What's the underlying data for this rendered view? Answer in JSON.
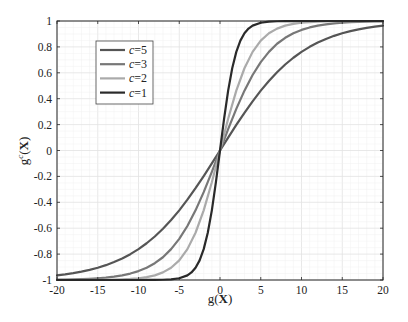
{
  "chart_data": {
    "type": "line",
    "title": "",
    "xlabel": "g(X)",
    "ylabel": "g^c(X)",
    "xlim": [
      -20,
      20
    ],
    "ylim": [
      -1,
      1
    ],
    "xticks": [
      -20,
      -15,
      -10,
      -5,
      0,
      5,
      10,
      15,
      20
    ],
    "yticks": [
      -1,
      -0.8,
      -0.6,
      -0.4,
      -0.2,
      0,
      0.2,
      0.4,
      0.6,
      0.8,
      1
    ],
    "grid": true,
    "minor_grid": true,
    "legend_position": "upper left",
    "series": [
      {
        "name": "c=5",
        "color": "#555555",
        "x": [
          -20,
          -19,
          -18,
          -17,
          -16,
          -15,
          -14,
          -13,
          -12,
          -11,
          -10,
          -9,
          -8,
          -7,
          -6,
          -5,
          -4,
          -3,
          -2,
          -1,
          0,
          1,
          2,
          3,
          4,
          5,
          6,
          7,
          8,
          9,
          10,
          11,
          12,
          13,
          14,
          15,
          16,
          17,
          18,
          19,
          20
        ],
        "values": [
          -0.964,
          -0.9562,
          -0.9468,
          -0.9354,
          -0.9217,
          -0.9051,
          -0.8854,
          -0.8617,
          -0.8337,
          -0.8005,
          -0.7616,
          -0.7163,
          -0.664,
          -0.6044,
          -0.537,
          -0.4621,
          -0.3799,
          -0.2913,
          -0.1974,
          -0.0997,
          0,
          0.0997,
          0.1974,
          0.2913,
          0.3799,
          0.4621,
          0.537,
          0.6044,
          0.664,
          0.7163,
          0.7616,
          0.8005,
          0.8337,
          0.8617,
          0.8854,
          0.9051,
          0.9217,
          0.9354,
          0.9468,
          0.9562,
          0.964
        ]
      },
      {
        "name": "c=3",
        "color": "#777777",
        "x": [
          -20,
          -19,
          -18,
          -17,
          -16,
          -15,
          -14,
          -13,
          -12,
          -11,
          -10,
          -9,
          -8,
          -7,
          -6,
          -5,
          -4,
          -3,
          -2,
          -1,
          0,
          1,
          2,
          3,
          4,
          5,
          6,
          7,
          8,
          9,
          10,
          11,
          12,
          13,
          14,
          15,
          16,
          17,
          18,
          19,
          20
        ],
        "values": [
          -0.9975,
          -0.9964,
          -0.9951,
          -0.9932,
          -0.9904,
          -0.9866,
          -0.9813,
          -0.974,
          -0.964,
          -0.9503,
          -0.9311,
          -0.9051,
          -0.8701,
          -0.8243,
          -0.7616,
          -0.6823,
          -0.5828,
          -0.4621,
          -0.3215,
          -0.1651,
          0,
          0.1651,
          0.3215,
          0.4621,
          0.5828,
          0.6823,
          0.7616,
          0.8243,
          0.8701,
          0.9051,
          0.9311,
          0.9503,
          0.964,
          0.974,
          0.9813,
          0.9866,
          0.9904,
          0.9932,
          0.9951,
          0.9964,
          0.9975
        ]
      },
      {
        "name": "c=2",
        "color": "#aaaaaa",
        "x": [
          -20,
          -19,
          -18,
          -17,
          -16,
          -15,
          -14,
          -13,
          -12,
          -11,
          -10,
          -9,
          -8,
          -7,
          -6,
          -5,
          -4,
          -3,
          -2,
          -1,
          0,
          1,
          2,
          3,
          4,
          5,
          6,
          7,
          8,
          9,
          10,
          11,
          12,
          13,
          14,
          15,
          16,
          17,
          18,
          19,
          20
        ],
        "values": [
          -0.9999,
          -0.9998,
          -0.9998,
          -0.9996,
          -0.9993,
          -0.9989,
          -0.9982,
          -0.997,
          -0.9951,
          -0.9919,
          -0.9866,
          -0.978,
          -0.964,
          -0.9414,
          -0.9051,
          -0.8483,
          -0.7616,
          -0.6351,
          -0.4621,
          -0.2449,
          0,
          0.2449,
          0.4621,
          0.6351,
          0.7616,
          0.8483,
          0.9051,
          0.9414,
          0.964,
          0.978,
          0.9866,
          0.9919,
          0.9951,
          0.997,
          0.9982,
          0.9989,
          0.9993,
          0.9996,
          0.9998,
          0.9998,
          0.9999
        ]
      },
      {
        "name": "c=1",
        "color": "#2a2a2a",
        "x": [
          -20,
          -15,
          -12,
          -10,
          -9,
          -8,
          -7,
          -6,
          -5,
          -4,
          -3.5,
          -3,
          -2.5,
          -2,
          -1.5,
          -1,
          -0.5,
          0,
          0.5,
          1,
          1.5,
          2,
          2.5,
          3,
          3.5,
          4,
          5,
          6,
          7,
          8,
          9,
          10,
          12,
          15,
          20
        ],
        "values": [
          -1.0,
          -1.0,
          -1.0,
          -0.9999,
          -0.9998,
          -0.9993,
          -0.9982,
          -0.9951,
          -0.9866,
          -0.964,
          -0.9414,
          -0.9051,
          -0.8483,
          -0.7616,
          -0.6351,
          -0.4621,
          -0.2449,
          0,
          0.2449,
          0.4621,
          0.6351,
          0.7616,
          0.8483,
          0.9051,
          0.9414,
          0.964,
          0.9866,
          0.9951,
          0.9982,
          0.9993,
          0.9998,
          0.9999,
          1.0,
          1.0,
          1.0
        ]
      }
    ]
  },
  "legend": {
    "entries": [
      {
        "label": "c=5",
        "color": "#555555"
      },
      {
        "label": "c=3",
        "color": "#777777"
      },
      {
        "label": "c=2",
        "color": "#aaaaaa"
      },
      {
        "label": "c=1",
        "color": "#2a2a2a"
      }
    ]
  },
  "axes": {
    "x_tick_labels": [
      "-20",
      "-15",
      "-10",
      "-5",
      "0",
      "5",
      "10",
      "15",
      "20"
    ],
    "y_tick_labels": [
      "-1",
      "-0.8",
      "-0.6",
      "-0.4",
      "-0.2",
      "0",
      "0.2",
      "0.4",
      "0.6",
      "0.8",
      "1"
    ],
    "xlabel_base": "g(",
    "xlabel_var": "X",
    "xlabel_close": ")",
    "ylabel_base": "g",
    "ylabel_sup": "c",
    "ylabel_open": "(",
    "ylabel_var": "X",
    "ylabel_close": ")"
  }
}
